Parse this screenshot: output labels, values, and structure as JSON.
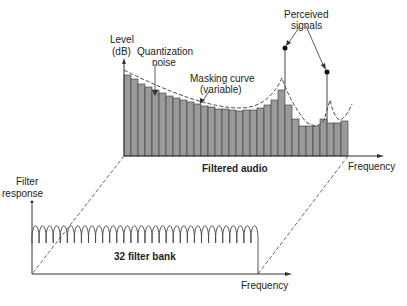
{
  "top_chart": {
    "y_label_line1": "Level",
    "y_label_line2": "(dB)",
    "x_label": "Frequency",
    "caption": "Filtered audio",
    "annotations": {
      "quant_line1": "Quantization",
      "quant_line2": "noise",
      "mask_line1": "Masking curve",
      "mask_line2": "(variable)",
      "signals_line1": "Perceived",
      "signals_line2": "signals"
    },
    "bar_fill": "#9a9a9a",
    "bar_heights": [
      81,
      77,
      72,
      69,
      66,
      63,
      60,
      58,
      56,
      54,
      52,
      50,
      49,
      47,
      47,
      46,
      45,
      46,
      46,
      48,
      51,
      56,
      66,
      51,
      37,
      30,
      30,
      30,
      37,
      33,
      33,
      35
    ]
  },
  "bottom_chart": {
    "y_label_line1": "Filter",
    "y_label_line2": "response",
    "x_label": "Frequency",
    "caption": "32 filter bank",
    "filter_count": 32
  }
}
